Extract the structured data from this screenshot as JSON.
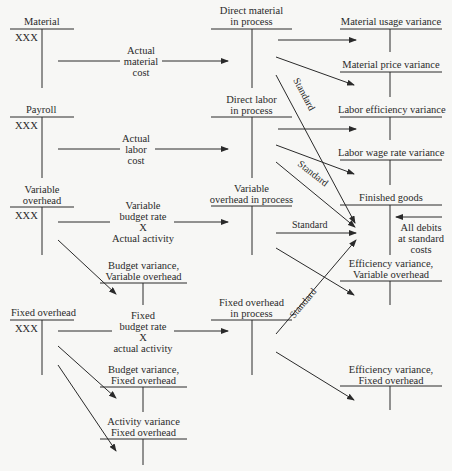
{
  "accounts": {
    "material": {
      "title": "Material",
      "entry": "XXX"
    },
    "payroll": {
      "title": "Payroll",
      "entry": "XXX"
    },
    "variable_overhead": {
      "title_l1": "Variable",
      "title_l2": "overhead",
      "entry": "XXX"
    },
    "fixed_overhead": {
      "title": "Fixed overhead",
      "entry": "XXX"
    },
    "dm_in_process": {
      "title_l1": "Direct material",
      "title_l2": "in process"
    },
    "dl_in_process": {
      "title_l1": "Direct labor",
      "title_l2": "in process"
    },
    "vo_in_process": {
      "title_l1": "Variable",
      "title_l2": "overhead in process"
    },
    "fo_in_process": {
      "title_l1": "Fixed overhead",
      "title_l2": "in process"
    },
    "material_usage_variance": {
      "title": "Material usage variance"
    },
    "material_price_variance": {
      "title": "Material price variance"
    },
    "labor_efficiency_variance": {
      "title": "Labor efficiency variance"
    },
    "labor_wage_rate_variance": {
      "title": "Labor wage rate variance"
    },
    "finished_goods": {
      "title": "Finished goods"
    },
    "efficiency_variance_vo": {
      "title_l1": "Efficiency variance,",
      "title_l2": "Variable overhead"
    },
    "budget_variance_vo": {
      "title_l1": "Budget variance,",
      "title_l2": "Variable overhead"
    },
    "budget_variance_fo": {
      "title_l1": "Budget variance,",
      "title_l2": "Fixed overhead"
    },
    "activity_variance_fo": {
      "title_l1": "Activity variance",
      "title_l2": "Fixed overhead"
    },
    "efficiency_variance_fo": {
      "title_l1": "Efficiency variance,",
      "title_l2": "Fixed overhead"
    }
  },
  "flows": {
    "actual_material_cost": {
      "l1": "Actual",
      "l2": "material",
      "l3": "cost"
    },
    "actual_labor_cost": {
      "l1": "Actual",
      "l2": "labor",
      "l3": "cost"
    },
    "variable_rate": {
      "l1": "Variable",
      "l2": "budget rate",
      "l3": "X",
      "l4": "Actual activity"
    },
    "fixed_rate": {
      "l1": "Fixed",
      "l2": "budget rate",
      "l3": "X",
      "l4": "actual activity"
    },
    "standard_label": "Standard",
    "all_debits": {
      "l1": "All debits",
      "l2": "at standard",
      "l3": "costs"
    }
  }
}
